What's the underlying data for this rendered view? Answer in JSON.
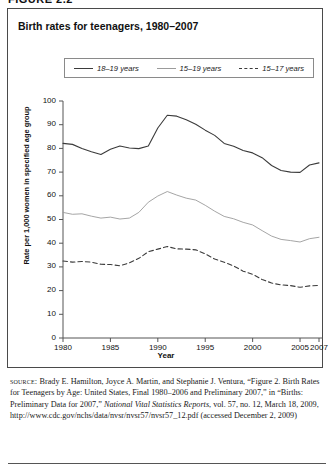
{
  "figure": {
    "number_label": "FIGURE 2.2",
    "title": "Birth rates for teenagers, 1980–2007"
  },
  "legend": {
    "items": [
      {
        "label": "18–19 years",
        "style": "solid-dark",
        "color": "#3b3b3b"
      },
      {
        "label": "15–19 years",
        "style": "solid-light",
        "color": "#9b9b9b"
      },
      {
        "label": "15–17 years",
        "style": "dashed",
        "color": "#3b3b3b"
      }
    ]
  },
  "axes": {
    "ylabel": "Rate per 1,000 women in specified age group",
    "xlabel": "Year",
    "yticks": [
      0,
      10,
      20,
      30,
      40,
      50,
      60,
      70,
      80,
      90,
      100
    ],
    "xticks": [
      "1980",
      "1985",
      "1990",
      "1995",
      "2000",
      "2005",
      "2007"
    ]
  },
  "source": {
    "keyword": "source:",
    "line1": " Brady E. Hamilton, Joyce A. Martin, and Stephanie J. Ventura,",
    "line2": "“Figure 2. Birth Rates for Teenagers by Age: United States, Final",
    "line3": "1980–2006 and Preliminary 2007,” in “Births: Preliminary Data for",
    "line4_pre": "2007,” ",
    "line4_italic": "National Vital Statistics Reports",
    "line4_post": ", vol. 57, no. 12, March 18,",
    "line5": "2009, http://www.cdc.gov/nchs/data/nvsr/nvsr57/nvsr57_12.pdf",
    "line6": "(accessed December 2, 2009)"
  },
  "chart_data": {
    "type": "line",
    "title": "Birth rates for teenagers, 1980–2007",
    "xlabel": "Year",
    "ylabel": "Rate per 1,000 women in specified age group",
    "xlim": [
      1980,
      2007
    ],
    "ylim": [
      0,
      100
    ],
    "grid": false,
    "legend_position": "top",
    "x": [
      1980,
      1981,
      1982,
      1983,
      1984,
      1985,
      1986,
      1987,
      1988,
      1989,
      1990,
      1991,
      1992,
      1993,
      1994,
      1995,
      1996,
      1997,
      1998,
      1999,
      2000,
      2001,
      2002,
      2003,
      2004,
      2005,
      2006,
      2007
    ],
    "series": [
      {
        "name": "18–19 years",
        "style": "solid",
        "color": "#3b3b3b",
        "values": [
          82.1,
          81.7,
          80.0,
          78.6,
          77.4,
          79.6,
          81.0,
          80.2,
          79.9,
          81.0,
          88.6,
          94.0,
          93.6,
          92.1,
          90.2,
          87.7,
          85.5,
          82.1,
          80.9,
          79.1,
          78.1,
          76.1,
          72.8,
          70.7,
          70.0,
          69.9,
          73.0,
          73.9
        ]
      },
      {
        "name": "15–19 years",
        "style": "solid",
        "color": "#9b9b9b",
        "values": [
          53.0,
          52.2,
          52.4,
          51.4,
          50.6,
          51.0,
          50.2,
          50.6,
          53.0,
          57.3,
          59.9,
          61.8,
          60.3,
          59.0,
          58.2,
          56.0,
          53.5,
          51.3,
          50.3,
          48.8,
          47.7,
          45.3,
          43.0,
          41.6,
          41.1,
          40.5,
          41.9,
          42.5
        ]
      },
      {
        "name": "15–17 years",
        "style": "dashed",
        "color": "#3b3b3b",
        "values": [
          32.5,
          32.0,
          32.3,
          32.0,
          31.1,
          31.0,
          30.5,
          31.7,
          33.6,
          36.4,
          37.5,
          38.6,
          37.6,
          37.5,
          37.2,
          35.5,
          33.3,
          32.0,
          30.4,
          28.2,
          26.9,
          24.7,
          23.2,
          22.4,
          22.1,
          21.4,
          22.0,
          22.2
        ]
      }
    ]
  }
}
